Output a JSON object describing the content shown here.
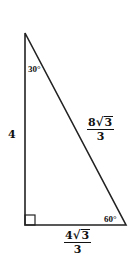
{
  "figure": {
    "type": "right-triangle",
    "stroke_color": "#222222",
    "vertices": {
      "top": [
        25,
        33
      ],
      "right_angle": [
        25,
        225
      ],
      "bottom_right": [
        126,
        225
      ]
    },
    "angles": {
      "top": "30°",
      "bottom_right": "60°",
      "right_angle_marker": true
    },
    "sides": {
      "vertical_leg": "4",
      "hypotenuse": {
        "coef": "8",
        "radicand": "3",
        "den": "3"
      },
      "horizontal_leg": {
        "coef": "4",
        "radicand": "3",
        "den": "3"
      }
    },
    "sqrt_symbol": "√"
  }
}
